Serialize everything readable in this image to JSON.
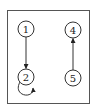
{
  "diagram": {
    "type": "directed-graph",
    "frame": {
      "x": 7.5,
      "y": 10.5,
      "width": 82,
      "height": 93,
      "stroke": "#555555"
    },
    "colors": {
      "stroke": "#333333",
      "fill": "#ffffff",
      "text": "#222222"
    },
    "nodes": [
      {
        "id": "1",
        "label": "1",
        "cx": 26,
        "cy": 29,
        "r": 8
      },
      {
        "id": "2",
        "label": "2",
        "cx": 26,
        "cy": 77,
        "r": 8
      },
      {
        "id": "4",
        "label": "4",
        "cx": 73,
        "cy": 30,
        "r": 8
      },
      {
        "id": "5",
        "label": "5",
        "cx": 73,
        "cy": 78,
        "r": 8
      }
    ],
    "edges": [
      {
        "from": "1",
        "to": "2",
        "type": "straight"
      },
      {
        "from": "5",
        "to": "4",
        "type": "straight"
      },
      {
        "from": "2",
        "to": "2",
        "type": "self-loop"
      }
    ]
  }
}
